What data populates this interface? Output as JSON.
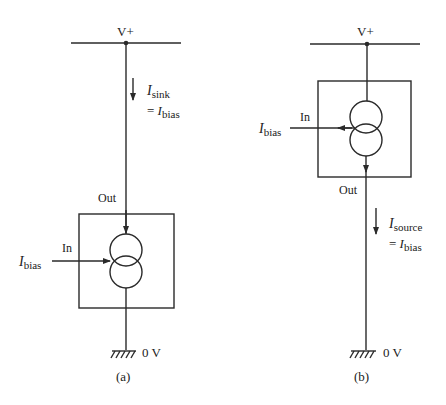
{
  "panels": [
    {
      "id": "a",
      "caption": "(a)",
      "supply_label": "V+",
      "ground_label": "0 V",
      "out_label": "Out",
      "in_label": "In",
      "input_current": {
        "symbol": "I",
        "sub": "bias"
      },
      "current": {
        "symbol": "I",
        "sub": "sink",
        "eq": "= I",
        "eq_sub": "bias"
      },
      "description": "Current sink: Ibias into In, Isink flows from V+ into Out, to 0 V"
    },
    {
      "id": "b",
      "caption": "(b)",
      "supply_label": "V+",
      "ground_label": "0 V",
      "out_label": "Out",
      "in_label": "In",
      "input_current": {
        "symbol": "I",
        "sub": "bias"
      },
      "current": {
        "symbol": "I",
        "sub": "source",
        "eq": "= I",
        "eq_sub": "bias"
      },
      "description": "Current source: Ibias out of In, Isource flows out of Out to 0 V"
    }
  ],
  "colors": {
    "line": "#2a2a2a",
    "text": "#222222",
    "background": "#ffffff"
  }
}
